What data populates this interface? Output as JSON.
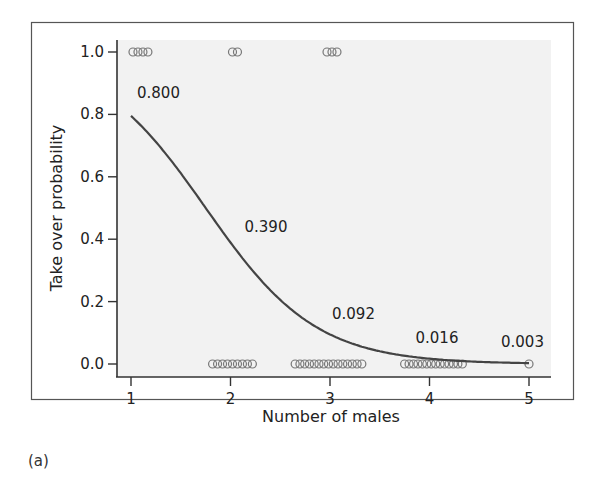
{
  "figure": {
    "panel_label": "(a)"
  },
  "chart_data": {
    "type": "line",
    "title": "",
    "xlabel": "Number of males",
    "ylabel": "Take over probability",
    "xlim": [
      0.85,
      5.2
    ],
    "ylim": [
      -0.04,
      1.04
    ],
    "xticks": [
      1,
      2,
      3,
      4,
      5
    ],
    "xtick_labels": [
      "1",
      "2",
      "3",
      "4",
      "5"
    ],
    "yticks": [
      0.0,
      0.2,
      0.4,
      0.6,
      0.8,
      1.0
    ],
    "ytick_labels": [
      "0.0",
      "0.2",
      "0.4",
      "0.6",
      "0.8",
      "1.0"
    ],
    "grid": false,
    "legend": null,
    "series": [
      {
        "name": "Fitted logistic curve",
        "type": "line",
        "x": [
          1,
          2,
          3,
          4,
          5
        ],
        "y": [
          0.8,
          0.39,
          0.092,
          0.016,
          0.003
        ],
        "color": "#444444"
      }
    ],
    "point_labels": [
      {
        "x": 1,
        "y": 0.8,
        "text": "0.800"
      },
      {
        "x": 2,
        "y": 0.39,
        "text": "0.390"
      },
      {
        "x": 3,
        "y": 0.092,
        "text": "0.092"
      },
      {
        "x": 4,
        "y": 0.016,
        "text": "0.016"
      },
      {
        "x": 5,
        "y": 0.003,
        "text": "0.003"
      }
    ],
    "observations": [
      {
        "name": "Take over (y=1)",
        "y": 1.0,
        "x_groups": [
          {
            "x_start": 1.02,
            "x_end": 1.17,
            "count": 4
          },
          {
            "x_start": 2.02,
            "x_end": 2.07,
            "count": 2
          },
          {
            "x_start": 2.97,
            "x_end": 3.07,
            "count": 3
          }
        ]
      },
      {
        "name": "No take over (y=0)",
        "y": 0.0,
        "x_groups": [
          {
            "x_start": 1.82,
            "x_end": 2.22,
            "count": 9
          },
          {
            "x_start": 2.65,
            "x_end": 3.32,
            "count": 15
          },
          {
            "x_start": 3.75,
            "x_end": 4.33,
            "count": 14
          },
          {
            "x_start": 5.0,
            "x_end": 5.0,
            "count": 1
          }
        ]
      }
    ],
    "colors": {
      "plot_background": "#f2f2f2",
      "axis": "#333333",
      "frame": "#555555",
      "marker": "#777777",
      "curve": "#444444"
    }
  }
}
